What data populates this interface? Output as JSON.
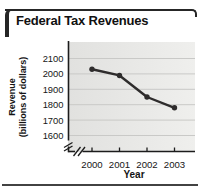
{
  "title": "Federal Tax Revenues",
  "chart_data": {
    "type": "line",
    "title": "Federal Tax Revenues",
    "xlabel": "Year",
    "ylabel": "Revenue (billions of dollars)",
    "ylabel_lines": [
      "Revenue",
      "(billions of dollars)"
    ],
    "categories": [
      "2000",
      "2001",
      "2002",
      "2003"
    ],
    "values": [
      2030,
      1990,
      1850,
      1780
    ],
    "yticks": [
      2100,
      2000,
      1900,
      1800,
      1700,
      1600
    ],
    "ylim": [
      1550,
      2200
    ],
    "grid": true,
    "legend": "none",
    "marker": "circle",
    "x_axis_break": true,
    "y_axis_break": true
  },
  "colors": {
    "line": "#2e2c2c",
    "axis": "#1c1c1c",
    "gridline": "#c9c9c7",
    "text": "#161616",
    "plot_bg_left": "#e1e1df",
    "plot_bg_right": "#efefed",
    "frame": "#262626",
    "rule": "#424242"
  }
}
